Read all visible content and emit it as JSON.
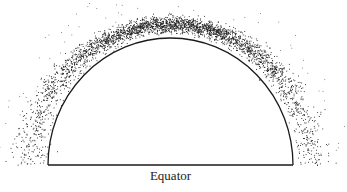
{
  "diagram": {
    "equator_label": "Equator",
    "colors": {
      "ink": "#1a1a1a",
      "background": "#ffffff"
    }
  }
}
